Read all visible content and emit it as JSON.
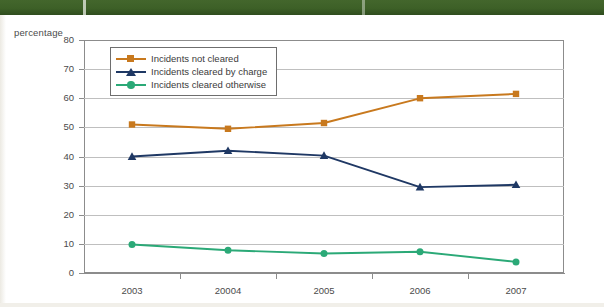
{
  "axis_title": "percentage",
  "legend": {
    "items": [
      {
        "label": "Incidents not cleared",
        "color": "#c8791e",
        "marker": "square"
      },
      {
        "label": "Incidents cleared by charge",
        "color": "#1f3864",
        "marker": "triangle"
      },
      {
        "label": "Incidents cleared otherwise",
        "color": "#2ba977",
        "marker": "circle"
      }
    ]
  },
  "chart_data": {
    "type": "line",
    "title": "",
    "subtitle": "",
    "xlabel": "",
    "ylabel": "percentage",
    "categories": [
      "2003",
      "20004",
      "2005",
      "2006",
      "2007"
    ],
    "ylim": [
      0,
      80
    ],
    "yticks": [
      0,
      10,
      20,
      30,
      40,
      50,
      60,
      70,
      80
    ],
    "ytick_labels": [
      "0",
      "10",
      "20",
      "30",
      "40",
      "50",
      "60",
      "70",
      "80"
    ],
    "grid": true,
    "legend_position": "upper-left-inside",
    "series": [
      {
        "name": "Incidents not cleared",
        "color": "#c8791e",
        "marker": "square",
        "values": [
          51.0,
          49.5,
          51.5,
          60.0,
          61.5
        ]
      },
      {
        "name": "Incidents cleared by charge",
        "color": "#1f3864",
        "marker": "triangle",
        "values": [
          40.0,
          42.0,
          40.3,
          29.5,
          30.3
        ]
      },
      {
        "name": "Incidents cleared otherwise",
        "color": "#2ba977",
        "marker": "circle",
        "values": [
          9.8,
          7.8,
          6.7,
          7.3,
          3.8
        ]
      }
    ]
  },
  "colors": {
    "grid": "#bfbfbf",
    "frame": "#8c8c8c",
    "scan_band": "#3d6027",
    "text": "#4b4b4b"
  }
}
